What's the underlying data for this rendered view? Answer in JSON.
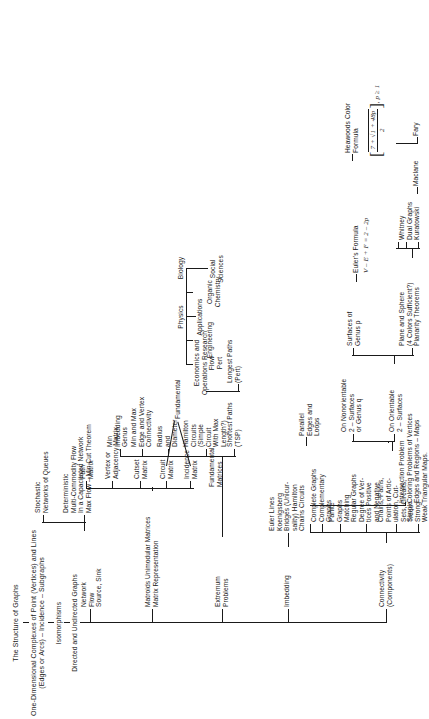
{
  "title": {
    "line1": "The Structure of Graphs",
    "line2": "One-Dimensional Complexes of Point (Vertices) and Lines",
    "line3": "(Edges or Arcs) – Incidence – Subgraphs",
    "isomorphisms": "Isomorphisms",
    "root": "Directed and Undirected Graphs"
  },
  "branches": {
    "connectivity": "Connectivity\n(Components)",
    "imbedding": "Imbedding",
    "extremum": "Extremum\nProblems",
    "matroids": "Matroids Unimodular Matrices\nMatrix Representation",
    "network_flow": "Network\nFlow\nSource, Sink"
  },
  "connectivity_children": [
    {
      "label": "Simple\nStrong\nWeak"
    },
    {
      "label": "Chains, Paths,\nPoints of Artic-\nulation, Cut-\nSets, Circuits,\nTrees"
    },
    {
      "label": "Regular Graphs\nDegree of Ver-\ntices Positive\nand Negative"
    },
    {
      "label": "Partite\nGraphs\nMatching"
    },
    {
      "label": "Complete Graphs\nComplementary\nGraphs"
    },
    {
      "label": "Parallel\nEdges and\nLoops"
    }
  ],
  "imbedding_children": [
    {
      "label": "Euler Lines\nKoenigsberg\nBridges (Unicur-\nsality) Hamilton\nChains Circuits"
    }
  ],
  "coloring": {
    "header": "Intersection Problem\nColoring Problems of Vertices\nEdges and Regions – Maps\nTriangular Maps.",
    "orientable": "On Orientable\n2 – Surfaces",
    "nonorientable": "On Nonorientable\n2 – Surfaces\nor Genus q",
    "plane": "Plane and Sphere\n(4 Colors Sufficient?)\nPlanarity Theorems",
    "genus_p": "Surfaces of\nGenus p",
    "kuratowski": "Kuratowski",
    "whitney": "Whitney\nDual Graphs",
    "maclane": "Maclane",
    "fary": "Fary",
    "eulers_formula_label": "Euler's Formula",
    "eulers_formula": "V – E + F = 2 – 2p",
    "heawood_label": "Heawoods Color\nFormula",
    "heawood_num": "7 + √1 + 48p",
    "heawood_den": "2",
    "heawood_cond": ", p ≥ 1"
  },
  "extremum_children": [
    {
      "label": "Shortest Paths\n(TSP)"
    },
    {
      "label": "Hamilton\nCircuits\n(Simple\nCircuit\nWith Max\nLength?)"
    },
    {
      "label": "Radius\nand\nDiameter"
    },
    {
      "label": "Min and Max\nEdge and Vertex\nConnectivity"
    },
    {
      "label": "Min\nImbedding\nGenus"
    }
  ],
  "extremum_extra": {
    "longest_paths": "Longest Paths\n(Pert)"
  },
  "matrices": {
    "fundamental": "Fundamental",
    "fundamental_matrices": "Fundamental\nMatrices",
    "items": [
      {
        "label": "Incidence\nMatrix"
      },
      {
        "label": "Circuit\nMatrix"
      },
      {
        "label": "Cutset\nMatrix"
      },
      {
        "label": "Vertex or\nAdjacency Matrix"
      },
      {
        "label": "Path\nMatrix"
      }
    ]
  },
  "network_children": [
    {
      "label": "Deterministic\nMulti-Commodity Flow\nIn a Capacitated Network\nMax Flow – Min Cut Theorem"
    },
    {
      "label": "Stochastic\nNetworks of Queues"
    }
  ],
  "applications": {
    "header": "Applications",
    "items": [
      {
        "label": "Economics and\nOperations Research\nFlow\nPert"
      },
      {
        "label": "Engineering"
      },
      {
        "label": "Physics"
      },
      {
        "label": "Organic\nChemistry"
      },
      {
        "label": "Biology"
      },
      {
        "label": "Social\nSciences"
      }
    ]
  },
  "colors": {
    "ink": "#1a1a1a",
    "paper": "#ffffff"
  }
}
